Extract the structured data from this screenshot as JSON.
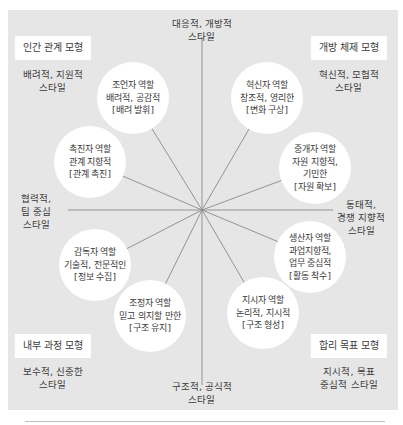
{
  "diagram": {
    "type": "competing-values-framework",
    "center": {
      "x": 202,
      "y": 210
    },
    "colors": {
      "panel": "#e6e6e6",
      "bubble": "#ffffff",
      "line": "#8a8a8a",
      "text": "#3a3a3a"
    },
    "axis_labels": {
      "top": {
        "line1": "대응적, 개방적",
        "line2": "스타일"
      },
      "bottom": {
        "line1": "구조적, 공식적",
        "line2": "스타일"
      },
      "left": {
        "line1": "협력적,",
        "line2": "팀 중심",
        "line3": "스타일"
      },
      "right": {
        "line1": "동태적,",
        "line2": "경쟁 지향적",
        "line3": "스타일"
      }
    },
    "quadrants": [
      {
        "model": "인간 관계 모형",
        "style_line1": "배려적, 지원적",
        "style_line2": "스타일"
      },
      {
        "model": "개방 체제 모형",
        "style_line1": "혁신적, 모험적",
        "style_line2": "스타일"
      },
      {
        "model": "내부 과정 모형",
        "style_line1": "보수적, 신중한",
        "style_line2": "스타일"
      },
      {
        "model": "합리 목표 모형",
        "style_line1": "지시적, 목표",
        "style_line2": "중심적 스타일"
      }
    ],
    "roles": [
      {
        "role": "조언자 역할",
        "traits": [
          "배려적, 공감적"
        ],
        "focus": "[배려 발휘]"
      },
      {
        "role": "혁신자 역할",
        "traits": [
          "창조적, 영리한"
        ],
        "focus": "[변화 구상]"
      },
      {
        "role": "촉진자 역할",
        "traits": [
          "관계 지향적"
        ],
        "focus": "[관계 촉진]"
      },
      {
        "role": "중개자 역할",
        "traits": [
          "자원 지향적,",
          "기민한"
        ],
        "focus": "[자원 확보]"
      },
      {
        "role": "감독자 역할",
        "traits": [
          "기술적, 전문적인"
        ],
        "focus": "[정보 수집]"
      },
      {
        "role": "생산자 역할",
        "traits": [
          "과업지향적,",
          "업무 중심적"
        ],
        "focus": "[활동 착수]"
      },
      {
        "role": "조정자 역할",
        "traits": [
          "믿고 의지할 만한"
        ],
        "focus": "[구조 유지]"
      },
      {
        "role": "지시자 역할",
        "traits": [
          "논리적, 지시적"
        ],
        "focus": "[구조 형성]"
      }
    ]
  }
}
